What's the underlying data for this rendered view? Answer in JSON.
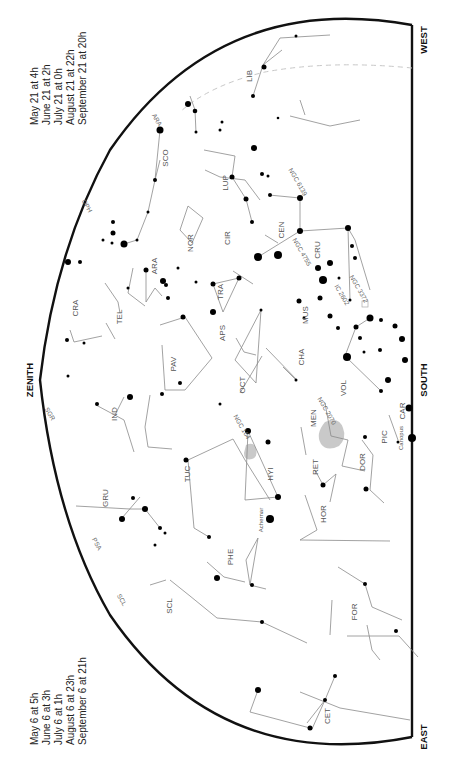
{
  "directions": {
    "west": "WEST",
    "south": "SOUTH",
    "east": "EAST",
    "zenith": "ZENITH"
  },
  "times_top": [
    "May 21 at   4h",
    "June 21 at   2h",
    "July 21 at   0h",
    "August 21 at 22h",
    "September 21 at 20h"
  ],
  "times_bottom": [
    "May 6 at   5h",
    "June 6 at   3h",
    "July 6 at   1h",
    "August 6 at 23h",
    "September 6 at 21h"
  ],
  "constellations": [
    {
      "name": "LIB",
      "x": 252,
      "y": 76
    },
    {
      "name": "SCO",
      "x": 168,
      "y": 158
    },
    {
      "name": "LUP",
      "x": 228,
      "y": 183
    },
    {
      "name": "NOR",
      "x": 193,
      "y": 243
    },
    {
      "name": "CIR",
      "x": 230,
      "y": 238
    },
    {
      "name": "CEN",
      "x": 284,
      "y": 230
    },
    {
      "name": "CRU",
      "x": 320,
      "y": 250
    },
    {
      "name": "ARA",
      "x": 157,
      "y": 266
    },
    {
      "name": "TRA",
      "x": 223,
      "y": 292
    },
    {
      "name": "CRA",
      "x": 78,
      "y": 308
    },
    {
      "name": "TEL",
      "x": 122,
      "y": 317
    },
    {
      "name": "MUS",
      "x": 308,
      "y": 315
    },
    {
      "name": "APS",
      "x": 225,
      "y": 333
    },
    {
      "name": "PAV",
      "x": 176,
      "y": 364
    },
    {
      "name": "CHA",
      "x": 304,
      "y": 357
    },
    {
      "name": "OCT",
      "x": 245,
      "y": 385
    },
    {
      "name": "VOL",
      "x": 346,
      "y": 388
    },
    {
      "name": "IND",
      "x": 117,
      "y": 414
    },
    {
      "name": "MEN",
      "x": 316,
      "y": 418
    },
    {
      "name": "CAR",
      "x": 405,
      "y": 411
    },
    {
      "name": "PIC",
      "x": 387,
      "y": 437
    },
    {
      "name": "TUC",
      "x": 190,
      "y": 474
    },
    {
      "name": "HYI",
      "x": 273,
      "y": 474
    },
    {
      "name": "RET",
      "x": 318,
      "y": 467
    },
    {
      "name": "DOR",
      "x": 365,
      "y": 462
    },
    {
      "name": "GRU",
      "x": 108,
      "y": 498
    },
    {
      "name": "HOR",
      "x": 326,
      "y": 514
    },
    {
      "name": "PHE",
      "x": 233,
      "y": 557
    },
    {
      "name": "SCL",
      "x": 172,
      "y": 606
    },
    {
      "name": "FOR",
      "x": 357,
      "y": 612
    },
    {
      "name": "CET",
      "x": 330,
      "y": 716
    }
  ],
  "deep_sky": [
    {
      "name": "NGC 6139",
      "x": 296,
      "y": 183
    },
    {
      "name": "NGC 4755",
      "x": 300,
      "y": 253
    },
    {
      "name": "NGC 3372",
      "x": 357,
      "y": 290
    },
    {
      "name": "IC 2602",
      "x": 340,
      "y": 296
    },
    {
      "name": "NGC 2070",
      "x": 325,
      "y": 412
    },
    {
      "name": "NGC 104",
      "x": 240,
      "y": 428
    }
  ],
  "named_stars": [
    {
      "name": "Achernar",
      "x": 263,
      "y": 520
    },
    {
      "name": "Canopus",
      "x": 403,
      "y": 438
    }
  ],
  "edge_labels": [
    {
      "name": "OPH",
      "x": 85,
      "y": 207
    },
    {
      "name": "SGR",
      "x": 48,
      "y": 415
    },
    {
      "name": "PSA",
      "x": 95,
      "y": 545
    },
    {
      "name": "SCL",
      "x": 120,
      "y": 601
    },
    {
      "name": "ARA",
      "x": 155,
      "y": 121
    }
  ]
}
